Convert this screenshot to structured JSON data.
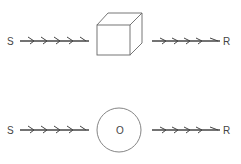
{
  "diagram": {
    "top_row": {
      "stimulus_label": "S",
      "response_label": "R",
      "organism_shape": "cube",
      "organism_label": ""
    },
    "bottom_row": {
      "stimulus_label": "S",
      "response_label": "R",
      "organism_shape": "circle",
      "organism_label": "O"
    },
    "colors": {
      "stroke": "#555555",
      "text": "#444444",
      "background": "#ffffff"
    }
  }
}
